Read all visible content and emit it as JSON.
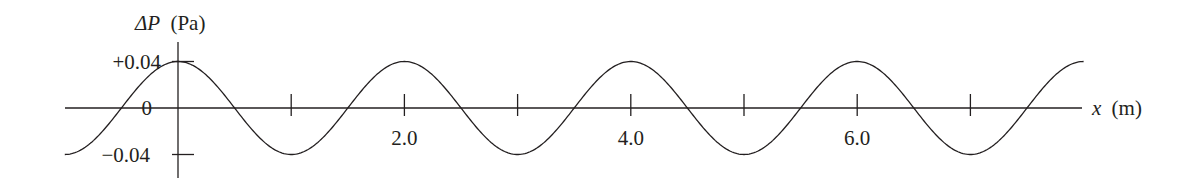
{
  "chart_data": {
    "type": "line",
    "title": "",
    "xlabel": "x (m)",
    "ylabel": "ΔP (Pa)",
    "ylabel_symbol": "ΔP",
    "ylabel_unit": "(Pa)",
    "xlabel_symbol": "x",
    "xlabel_unit": "(m)",
    "function": "ΔP = 0.04·cos(2πx/λ)",
    "amplitude": 0.04,
    "wavelength": 2.0,
    "xlim": [
      -1.0,
      8.0
    ],
    "ylim": [
      -0.04,
      0.04
    ],
    "x_ticks": [
      1.0,
      2.0,
      3.0,
      4.0,
      5.0,
      6.0,
      7.0
    ],
    "x_tick_labels": [
      {
        "value": 2.0,
        "label": "2.0"
      },
      {
        "value": 4.0,
        "label": "4.0"
      },
      {
        "value": 6.0,
        "label": "6.0"
      }
    ],
    "y_tick_labels": [
      {
        "value": 0.04,
        "label": "+0.04"
      },
      {
        "value": 0,
        "label": "0"
      },
      {
        "value": -0.04,
        "label": "−0.04"
      }
    ],
    "series": [
      {
        "name": "ΔP",
        "x": [
          -1.0,
          -0.5,
          0.0,
          0.5,
          1.0,
          1.5,
          2.0,
          2.5,
          3.0,
          3.5,
          4.0,
          4.5,
          5.0,
          5.5,
          6.0,
          6.5,
          7.0,
          7.5,
          8.0
        ],
        "y": [
          -0.04,
          0,
          0.04,
          0,
          -0.04,
          0,
          0.04,
          0,
          -0.04,
          0,
          0.04,
          0,
          -0.04,
          0,
          0.04,
          0,
          -0.04,
          0,
          0.04
        ]
      }
    ],
    "grid": false,
    "legend": "none",
    "colors": {
      "line": "#231f20",
      "background": "#ffffff"
    }
  }
}
